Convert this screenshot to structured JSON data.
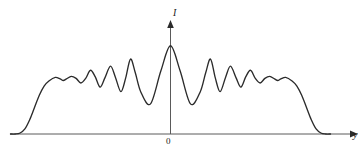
{
  "figure": {
    "background_color": "#ffffff",
    "line_color": "#2b2b2b",
    "axis_color": "#555555",
    "width": 363,
    "height": 155
  },
  "labels": {
    "y_axis": "I",
    "x_axis": "y",
    "origin": "0"
  },
  "icons": {
    "x_arrow": "arrow-right-icon",
    "y_arrow": "arrow-up-icon"
  },
  "chart_data": {
    "type": "line",
    "title": "",
    "subtitle": "",
    "xlabel": "y",
    "ylabel": "I",
    "grid": false,
    "legend": null,
    "annotations": [
      {
        "text": "0",
        "x": 0,
        "y": 0,
        "role": "origin-tick"
      }
    ],
    "axis_ranges": {
      "x": [
        -1.0,
        1.0
      ],
      "y": [
        0,
        1.0
      ]
    },
    "peaks": {
      "x": [
        -0.72,
        -0.62,
        -0.5,
        -0.375,
        -0.25,
        0.0,
        0.25,
        0.375,
        0.5,
        0.62,
        0.72
      ],
      "height": [
        0.555,
        0.565,
        0.625,
        0.665,
        0.735,
        0.865,
        0.735,
        0.665,
        0.625,
        0.565,
        0.555
      ]
    },
    "valleys": {
      "x": [
        -0.67,
        -0.56,
        -0.44,
        -0.31,
        -0.125,
        0.125,
        0.31,
        0.44,
        0.56,
        0.67
      ],
      "height": [
        0.525,
        0.5,
        0.46,
        0.415,
        0.295,
        0.295,
        0.415,
        0.46,
        0.5,
        0.525
      ]
    },
    "envelope_zero_crossings": {
      "x": [
        -0.94,
        0.94
      ]
    },
    "x": [
      -1.0,
      -0.97,
      -0.94,
      -0.91,
      -0.88,
      -0.85,
      -0.82,
      -0.79,
      -0.76,
      -0.72,
      -0.69,
      -0.67,
      -0.65,
      -0.62,
      -0.59,
      -0.56,
      -0.53,
      -0.5,
      -0.47,
      -0.44,
      -0.41,
      -0.375,
      -0.345,
      -0.31,
      -0.28,
      -0.25,
      -0.22,
      -0.185,
      -0.125,
      -0.06,
      0.0,
      0.06,
      0.125,
      0.185,
      0.22,
      0.25,
      0.28,
      0.31,
      0.345,
      0.375,
      0.41,
      0.44,
      0.47,
      0.5,
      0.53,
      0.56,
      0.59,
      0.62,
      0.65,
      0.67,
      0.69,
      0.72,
      0.76,
      0.79,
      0.82,
      0.85,
      0.88,
      0.91,
      0.94,
      0.97,
      1.0
    ],
    "values": [
      0.0,
      0.0,
      0.01,
      0.05,
      0.14,
      0.26,
      0.38,
      0.47,
      0.52,
      0.555,
      0.54,
      0.525,
      0.54,
      0.565,
      0.545,
      0.5,
      0.545,
      0.625,
      0.56,
      0.46,
      0.55,
      0.665,
      0.56,
      0.415,
      0.55,
      0.735,
      0.6,
      0.41,
      0.295,
      0.62,
      0.865,
      0.62,
      0.295,
      0.41,
      0.6,
      0.735,
      0.55,
      0.415,
      0.56,
      0.665,
      0.55,
      0.46,
      0.56,
      0.625,
      0.545,
      0.5,
      0.545,
      0.565,
      0.54,
      0.525,
      0.54,
      0.555,
      0.52,
      0.47,
      0.38,
      0.26,
      0.14,
      0.05,
      0.01,
      0.0,
      0.0
    ]
  }
}
